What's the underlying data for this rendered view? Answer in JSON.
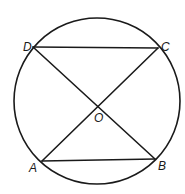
{
  "diagram": {
    "type": "geometry",
    "circle": {
      "center": "O"
    },
    "points": [
      {
        "id": "A",
        "label": "A",
        "on_circle": true
      },
      {
        "id": "B",
        "label": "B",
        "on_circle": true
      },
      {
        "id": "C",
        "label": "C",
        "on_circle": true
      },
      {
        "id": "D",
        "label": "D",
        "on_circle": true
      },
      {
        "id": "O",
        "label": "O",
        "on_circle": false
      }
    ],
    "segments": [
      {
        "from": "D",
        "to": "C"
      },
      {
        "from": "A",
        "to": "B"
      },
      {
        "from": "D",
        "to": "B"
      },
      {
        "from": "C",
        "to": "A"
      }
    ],
    "colors": {
      "stroke": "#1a1a1a",
      "background": "#ffffff"
    }
  }
}
